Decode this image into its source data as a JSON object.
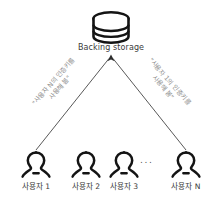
{
  "diagram": {
    "title_text": "Backing storage",
    "background_color": "#ffffff",
    "stroke_color": "#1a1a1a",
    "label_color": "#3b3b3b",
    "edge_label_color": "#8d8d8d",
    "storage": {
      "icon": "database-cylinder-icon",
      "label": "Backing storage"
    },
    "edges": [
      {
        "id": "edge-left",
        "from": "사용자 1",
        "to": "Backing storage",
        "label_line1": "\"사용자 N의 인증키를",
        "label_line2": "사용해 봄\"",
        "arrow": "up"
      },
      {
        "id": "edge-right",
        "from": "사용자 N",
        "to": "Backing storage",
        "label_line1": "\"사용자 1의 인증키를",
        "label_line2": "사용해 봄\"",
        "arrow": "up"
      }
    ],
    "users": [
      {
        "id": "user-1",
        "label": "사용자 1",
        "icon": "person-icon"
      },
      {
        "id": "user-2",
        "label": "사용자 2",
        "icon": "person-icon"
      },
      {
        "id": "user-3",
        "label": "사용자 3",
        "icon": "person-icon"
      },
      {
        "id": "user-n",
        "label": "사용자 N",
        "icon": "person-icon"
      }
    ],
    "ellipsis": "..."
  }
}
